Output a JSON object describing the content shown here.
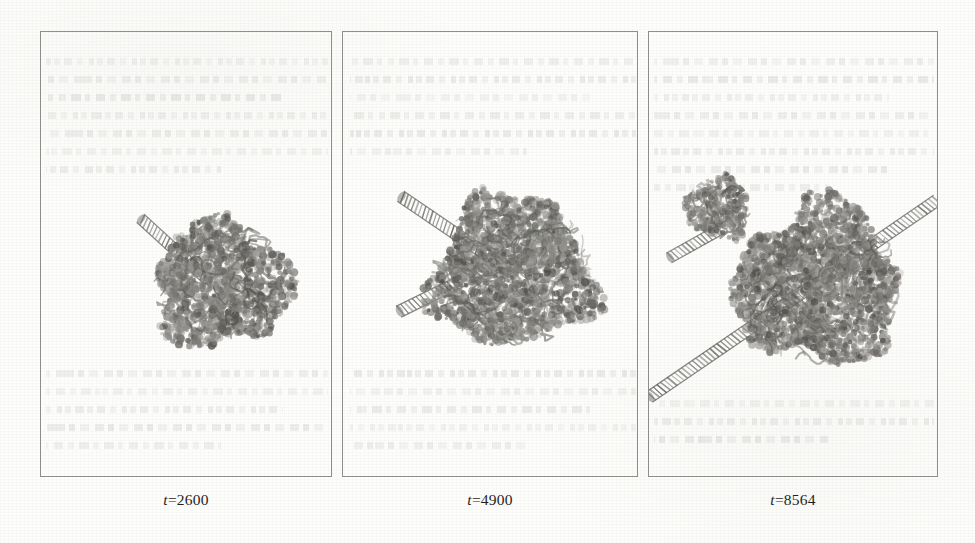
{
  "figure": {
    "kind": "molecular-dynamics-snapshot-series",
    "panel_count": 3,
    "background_color": "#fdfdfb",
    "border_color": "#8e8e8a",
    "ink_color": "#55544f",
    "caption_color": "#1e1e1c"
  },
  "panels": [
    {
      "id": "panel-1",
      "caption_var": "t",
      "caption_eq": "=2600",
      "caption_full": "t=2600",
      "x": 40,
      "y": 31,
      "w": 292,
      "h": 446,
      "caption_x": 40,
      "caption_y": 491,
      "caption_w": 292,
      "structures": {
        "core_blob": {
          "cx": 222,
          "cy": 285,
          "rx": 68,
          "ry": 62
        },
        "rods": [
          {
            "x1": 140,
            "y1": 218,
            "x2": 208,
            "y2": 280,
            "width": 11
          }
        ],
        "sub_blobs": []
      }
    },
    {
      "id": "panel-2",
      "caption_var": "t",
      "caption_eq": "=4900",
      "caption_full": "t=4900",
      "x": 342,
      "y": 31,
      "w": 296,
      "h": 446,
      "caption_x": 342,
      "caption_y": 491,
      "caption_w": 296,
      "structures": {
        "core_blob": {
          "cx": 512,
          "cy": 272,
          "rx": 80,
          "ry": 76
        },
        "rods": [
          {
            "x1": 400,
            "y1": 196,
            "x2": 512,
            "y2": 272,
            "width": 12
          },
          {
            "x1": 398,
            "y1": 312,
            "x2": 500,
            "y2": 262,
            "width": 12
          }
        ],
        "sub_blobs": []
      }
    },
    {
      "id": "panel-3",
      "caption_var": "t",
      "caption_eq": "=8564",
      "caption_full": "t=8564",
      "x": 648,
      "y": 31,
      "w": 290,
      "h": 446,
      "caption_x": 648,
      "caption_y": 491,
      "caption_w": 290,
      "structures": {
        "core_blob": {
          "cx": 818,
          "cy": 285,
          "rx": 82,
          "ry": 80
        },
        "rods": [
          {
            "x1": 648,
            "y1": 398,
            "x2": 938,
            "y2": 200,
            "width": 12
          },
          {
            "x1": 668,
            "y1": 258,
            "x2": 722,
            "y2": 228,
            "width": 11
          }
        ],
        "sub_blobs": [
          {
            "cx": 718,
            "cy": 208,
            "rx": 32,
            "ry": 30
          }
        ]
      }
    }
  ],
  "bleed_through": {
    "note": "faint illegible mirrored text from reverse side of scanned page",
    "opacity": 0.135,
    "blocks": [
      {
        "x": 46,
        "y": 58,
        "w": 282,
        "h": 150,
        "lines": 7
      },
      {
        "x": 46,
        "y": 370,
        "w": 282,
        "h": 100,
        "lines": 5
      },
      {
        "x": 350,
        "y": 58,
        "w": 286,
        "h": 130,
        "lines": 6
      },
      {
        "x": 350,
        "y": 370,
        "w": 286,
        "h": 100,
        "lines": 5
      },
      {
        "x": 654,
        "y": 58,
        "w": 280,
        "h": 168,
        "lines": 8
      },
      {
        "x": 654,
        "y": 400,
        "w": 280,
        "h": 70,
        "lines": 3
      }
    ]
  }
}
